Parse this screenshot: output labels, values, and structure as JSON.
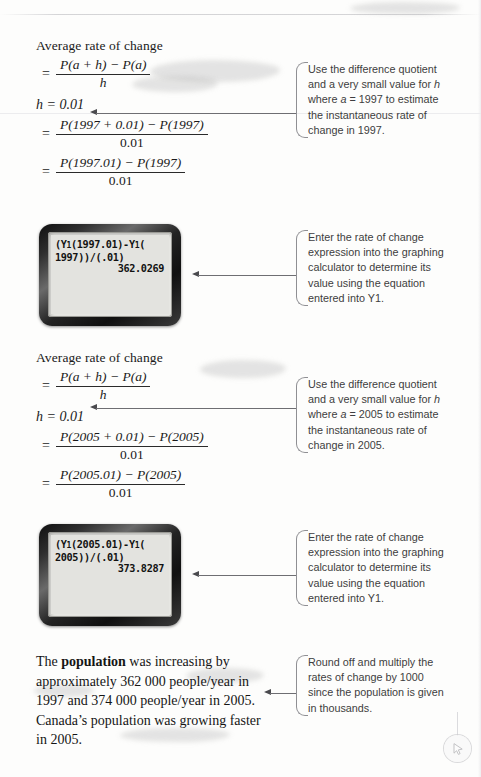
{
  "page": {
    "domain_label": "scanned-textbook-page",
    "cursor_icon": "mouse-pointer-icon"
  },
  "sections": [
    {
      "id": "section-1997",
      "heading": "Average rate of change",
      "fraction_general": {
        "numerator": "P(a + h)  −  P(a)",
        "denominator": "h"
      },
      "h_line": "h = 0.01",
      "fraction_step1": {
        "numerator": "P(1997 + 0.01)  −  P(1997)",
        "denominator": "0.01"
      },
      "fraction_step2": {
        "numerator": "P(1997.01)  −  P(1997)",
        "denominator": "0.01"
      },
      "note": {
        "line1": "Use the difference quotient",
        "line2": "and a very small value for ",
        "line2_var": "h",
        "line3_pre": "where ",
        "line3_var": "a",
        "line3_post": " =  1997 to estimate",
        "line4": "the instantaneous rate of",
        "line5": "change in 1997."
      }
    },
    {
      "id": "section-2005",
      "heading": "Average rate of change",
      "fraction_general": {
        "numerator": "P(a + h)  −  P(a)",
        "denominator": "h"
      },
      "h_line": "h = 0.01",
      "fraction_step1": {
        "numerator": "P(2005 + 0.01)  −  P(2005)",
        "denominator": "0.01"
      },
      "fraction_step2": {
        "numerator": "P(2005.01)  −  P(2005)",
        "denominator": "0.01"
      },
      "note": {
        "line1": "Use the difference quotient",
        "line2": "and a very small value for ",
        "line2_var": "h",
        "line3_pre": "where ",
        "line3_var": "a",
        "line3_post": " =  2005 to estimate",
        "line4": "the instantaneous rate of",
        "line5": "change in 2005."
      }
    }
  ],
  "calculators": [
    {
      "id": "calculator-1997",
      "entry_line1": "(Y",
      "entry_sub1": "1",
      "entry_line1b": "(1997.01)-Y",
      "entry_sub2": "1",
      "entry_line1c": "(",
      "entry_line2": "1997))/(.01)",
      "answer": "362.0269",
      "note": {
        "line1": "Enter the rate of change",
        "line2": "expression into the graphing",
        "line3": "calculator to determine its",
        "line4": "value using the equation",
        "line5": "entered into Y1."
      }
    },
    {
      "id": "calculator-2005",
      "entry_line1": "(Y",
      "entry_sub1": "1",
      "entry_line1b": "(2005.01)-Y",
      "entry_sub2": "1",
      "entry_line1c": "(",
      "entry_line2": "2005))/(.01)",
      "answer": "373.8287",
      "note": {
        "line1": "Enter the rate of change",
        "line2": "expression into the graphing",
        "line3": "calculator to determine its",
        "line4": "value using the equation",
        "line5": "entered into Y1."
      }
    }
  ],
  "conclusion": {
    "pre": "The ",
    "bold_word": "population",
    "post": " was increasing by approximately 362 000 people/year in 1997 and 374 000 people/year in 2005. Canada’s population was growing faster in 2005.",
    "note": {
      "line1": "Round off and multiply the",
      "line2": "rates of change by 1000",
      "line3": "since the population is given",
      "line4": "in thousands."
    }
  }
}
